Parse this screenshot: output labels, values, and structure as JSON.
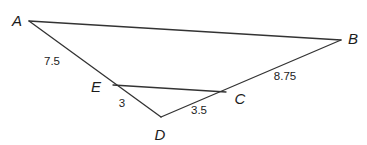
{
  "figure": {
    "type": "geometry-diagram",
    "width": 367,
    "height": 145,
    "background_color": "#ffffff",
    "stroke_color": "#333333",
    "stroke_width": 1.3,
    "points": [
      {
        "id": "A",
        "label": "A",
        "x": 29,
        "y": 21,
        "label_x": 17,
        "label_y": 20
      },
      {
        "id": "B",
        "label": "B",
        "x": 341,
        "y": 40,
        "label_x": 353,
        "label_y": 38
      },
      {
        "id": "C",
        "label": "C",
        "x": 226,
        "y": 92,
        "label_x": 240,
        "label_y": 98
      },
      {
        "id": "D",
        "label": "D",
        "x": 161,
        "y": 117,
        "label_x": 160,
        "label_y": 134
      },
      {
        "id": "E",
        "label": "E",
        "x": 113,
        "y": 85,
        "label_x": 96,
        "label_y": 86
      }
    ],
    "segments": [
      {
        "id": "AB",
        "from": "A",
        "to": "B"
      },
      {
        "id": "AD",
        "from": "A",
        "to": "D"
      },
      {
        "id": "BD",
        "from": "B",
        "to": "D"
      },
      {
        "id": "EC",
        "from": "E",
        "to": "C"
      }
    ],
    "measure_labels": [
      {
        "id": "AE",
        "text": "7.5",
        "x": 52,
        "y": 62,
        "segment": "AE"
      },
      {
        "id": "ED",
        "text": "3",
        "x": 122,
        "y": 104,
        "segment": "ED"
      },
      {
        "id": "DC",
        "text": "3.5",
        "x": 199,
        "y": 111,
        "segment": "DC"
      },
      {
        "id": "CB",
        "text": "8.75",
        "x": 285,
        "y": 77,
        "segment": "CB"
      }
    ]
  }
}
